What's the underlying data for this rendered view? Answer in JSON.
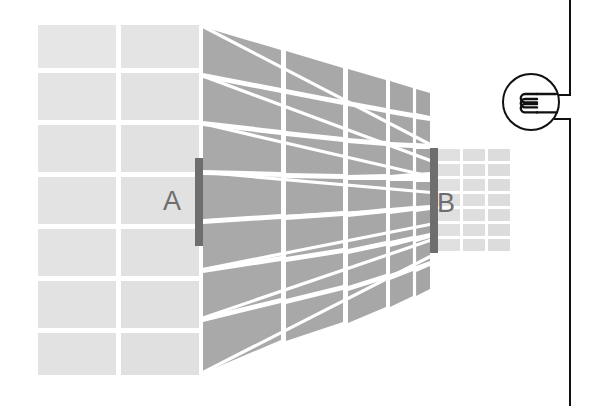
{
  "figure": {
    "background_color": "#ffffff"
  },
  "labels": [
    {
      "id": "A",
      "text": "A",
      "x": 163,
      "y": 188,
      "color": "#6e6e6e"
    },
    {
      "id": "B",
      "text": "B",
      "x": 437,
      "y": 190,
      "color": "#6e6e6e"
    }
  ],
  "colors": {
    "near_face": "#e3e3e3",
    "side_wall": "#a9a9a9",
    "far_face": "#e0e0e0",
    "grid_line": "#ffffff",
    "marker_bar": "#6e6e6e",
    "wire": "#111111",
    "label_text": "#6e6e6e"
  },
  "geometry": {
    "near_face": {
      "x": 38,
      "y": 25,
      "width": 161,
      "height": 350,
      "columns": 2,
      "rows": 7
    },
    "side_wall": {
      "near_x": 199,
      "near_top": 25,
      "near_bottom": 375,
      "far_x": 437,
      "far_top": 148,
      "far_bottom": 253,
      "columns": 8,
      "rows": 7
    },
    "far_face": {
      "x": 437,
      "y": 148,
      "width": 76,
      "height": 105,
      "columns": 3,
      "rows": 7
    },
    "marker_a": {
      "x": 195,
      "y": 158,
      "width": 8,
      "height": 88
    },
    "marker_b": {
      "x": 430,
      "y": 148,
      "width": 8,
      "height": 105
    }
  },
  "circuit": {
    "element": {
      "name": "solenoid-coil-symbol",
      "shape": "circle",
      "center_x": 531,
      "center_y": 102,
      "radius": 28,
      "coil_loops": 3
    },
    "wire": {
      "vertical_x": 570,
      "top_y": 0,
      "bottom_y": 406,
      "upper_terminal_y": 95,
      "lower_terminal_y": 119,
      "stroke_width": 2
    }
  },
  "icons": {
    "solenoid": "solenoid-coil-icon",
    "wire": "circuit-wire-icon"
  }
}
